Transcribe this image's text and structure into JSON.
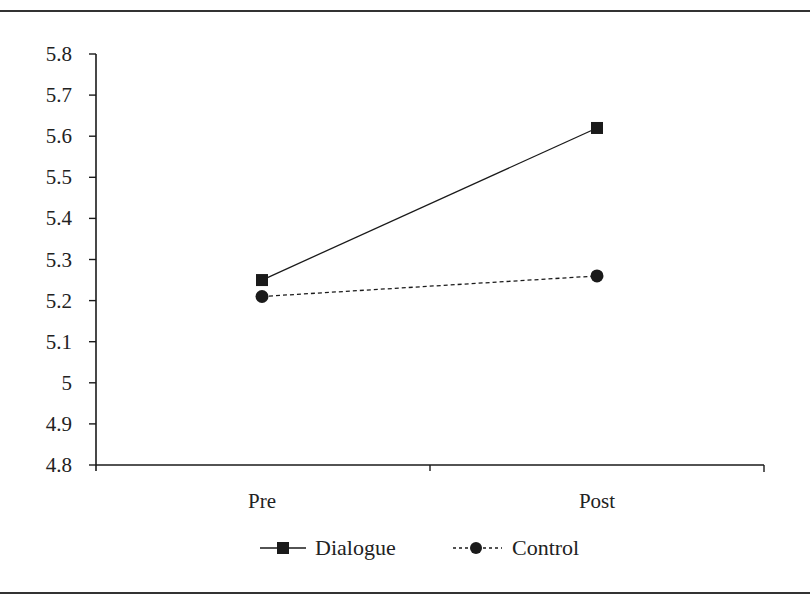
{
  "chart_data": {
    "type": "line",
    "title": "",
    "xlabel": "",
    "ylabel": "",
    "categories": [
      "Pre",
      "Post"
    ],
    "series": [
      {
        "name": "Dialogue",
        "values": [
          5.25,
          5.62
        ],
        "marker": "square",
        "line": "solid"
      },
      {
        "name": "Control",
        "values": [
          5.21,
          5.26
        ],
        "marker": "circle",
        "line": "dashed"
      }
    ],
    "ylim": [
      4.8,
      5.8
    ],
    "yticks": [
      "5.8",
      "5.7",
      "5.6",
      "5.5",
      "5.4",
      "5.3",
      "5.2",
      "5.1",
      "5",
      "4.9",
      "4.8"
    ],
    "grid": false,
    "legend_position": "bottom"
  },
  "colors": {
    "line": "#1a1a1a",
    "rule": "#333333"
  }
}
